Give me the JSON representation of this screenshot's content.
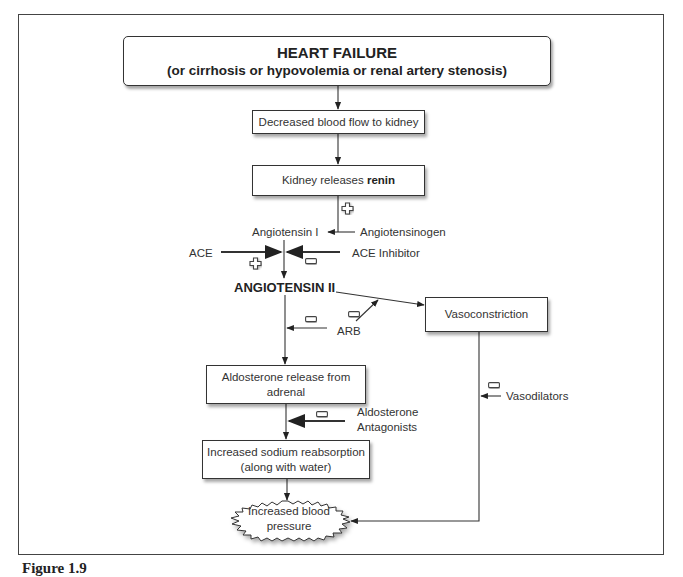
{
  "diagram": {
    "nodes": {
      "heart_failure": {
        "title": "HEART FAILURE",
        "subtitle": "(or cirrhosis or hypovolemia or renal artery stenosis)"
      },
      "decreased_flow": {
        "label": "Decreased blood flow to kidney"
      },
      "renin": {
        "prefix": "Kidney releases ",
        "bold": "renin"
      },
      "angiotensin_i": {
        "label": "Angiotensin I"
      },
      "angiotensinogen": {
        "label": "Angiotensinogen"
      },
      "ace": {
        "label": "ACE"
      },
      "ace_inhibitor": {
        "label": "ACE Inhibitor"
      },
      "angiotensin_ii": {
        "label": "ANGIOTENSIN II"
      },
      "arb": {
        "label": "ARB"
      },
      "vasoconstriction": {
        "label": "Vasoconstriction"
      },
      "aldosterone": {
        "line1": "Aldosterone release from",
        "line2": "adrenal"
      },
      "aldosterone_antagonists": {
        "line1": "Aldosterone",
        "line2": "Antagonists"
      },
      "sodium": {
        "line1": "Increased sodium reabsorption",
        "line2": "(along with water)"
      },
      "vasodilators": {
        "label": "Vasodilators"
      },
      "blood_pressure": {
        "line1": "Increased blood",
        "line2": "pressure"
      }
    },
    "signs": {
      "renin_effect": "+",
      "ace_effect": "+",
      "ace_inhibitor_effect": "-",
      "arb_effect_aldosterone": "-",
      "arb_effect_vasoconstriction": "-",
      "aldosterone_antagonist_effect": "-",
      "vasodilator_effect": "-"
    },
    "edges": [
      {
        "from": "heart_failure",
        "to": "decreased_flow"
      },
      {
        "from": "decreased_flow",
        "to": "renin"
      },
      {
        "from": "renin",
        "to": "angiotensin_i",
        "sign": "+"
      },
      {
        "from": "angiotensinogen",
        "to": "angiotensin_i"
      },
      {
        "from": "angiotensin_i",
        "to": "angiotensin_ii"
      },
      {
        "from": "ace",
        "to": "angiotensin_i_conversion",
        "sign": "+"
      },
      {
        "from": "ace_inhibitor",
        "to": "angiotensin_i_conversion",
        "sign": "-"
      },
      {
        "from": "angiotensin_ii",
        "to": "vasoconstriction"
      },
      {
        "from": "arb",
        "to": "angiotensin_ii_to_vasoconstriction",
        "sign": "-"
      },
      {
        "from": "arb",
        "to": "angiotensin_ii_to_aldosterone",
        "sign": "-"
      },
      {
        "from": "angiotensin_ii",
        "to": "aldosterone"
      },
      {
        "from": "aldosterone",
        "to": "sodium"
      },
      {
        "from": "aldosterone_antagonists",
        "to": "aldosterone_to_sodium",
        "sign": "-"
      },
      {
        "from": "sodium",
        "to": "blood_pressure"
      },
      {
        "from": "vasoconstriction",
        "to": "blood_pressure"
      },
      {
        "from": "vasodilators",
        "to": "vasoconstriction_to_blood_pressure",
        "sign": "-"
      }
    ]
  },
  "caption": {
    "label": "Figure 1.9"
  },
  "colors": {
    "line": "#333333",
    "text": "#333333",
    "frame": "#444444",
    "background": "#ffffff"
  }
}
